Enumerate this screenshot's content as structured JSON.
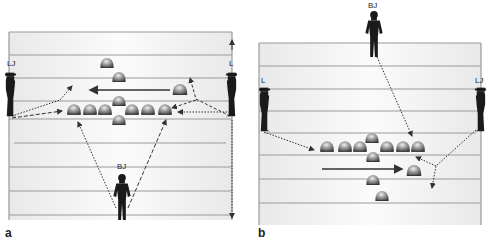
{
  "figure": {
    "panels": [
      {
        "id": "a",
        "label": "a",
        "officials": {
          "left": {
            "label": "LJ"
          },
          "right": {
            "label": "L"
          },
          "bottom": {
            "label": "BJ"
          }
        },
        "formation": {
          "offense_line": 7,
          "backfield_count": 4,
          "motion": "right-to-left"
        }
      },
      {
        "id": "b",
        "label": "b",
        "officials": {
          "left": {
            "label": "L"
          },
          "right": {
            "label": "LJ"
          },
          "top": {
            "label": "BJ"
          }
        },
        "formation": {
          "offense_line": 7,
          "backfield_count": 4,
          "motion": "left-to-right"
        }
      }
    ],
    "colors": {
      "field": "#f2f2f2",
      "yard_lines": "#9a9a9a",
      "silhouette": "#1a1a1a",
      "player_dark": "#5a5a5a",
      "player_light": "#d8d8d8",
      "arrow": "#333333"
    }
  }
}
